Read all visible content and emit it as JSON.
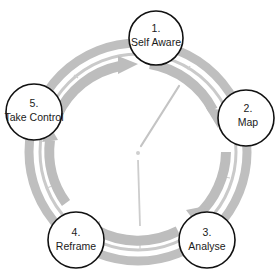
{
  "diagram": {
    "type": "cycle",
    "colors": {
      "ring": "#bdbdbd",
      "ring_thin": "#c8c8c8",
      "node_fill": "#ffffff",
      "node_stroke": "#111111",
      "text": "#1a1a1a",
      "clock_hand": "#c4c4c4"
    },
    "nodes": [
      {
        "number": "1.",
        "label": "Self Aware"
      },
      {
        "number": "2.",
        "label": "Map"
      },
      {
        "number": "3.",
        "label": "Analyse"
      },
      {
        "number": "4.",
        "label": "Reframe"
      },
      {
        "number": "5.",
        "label": "Take Control"
      }
    ],
    "flow": "clockwise: 1 → 2 → 3 → 4 → 5 → 1",
    "center_graphic": "clock-hands-icon"
  }
}
